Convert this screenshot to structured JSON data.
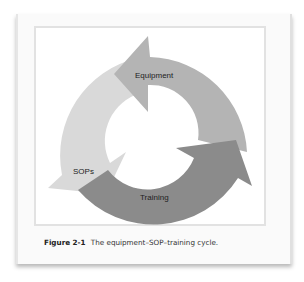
{
  "figure": {
    "number": "Figure 2-1",
    "caption": "The equipment–SOP–training cycle."
  },
  "diagram": {
    "type": "cycle",
    "nodes": [
      {
        "label": "Equipment",
        "color": "#b4b4b4"
      },
      {
        "label": "Training",
        "color": "#8b8b8b"
      },
      {
        "label": "SOPs",
        "color": "#d9d9d9"
      }
    ]
  }
}
